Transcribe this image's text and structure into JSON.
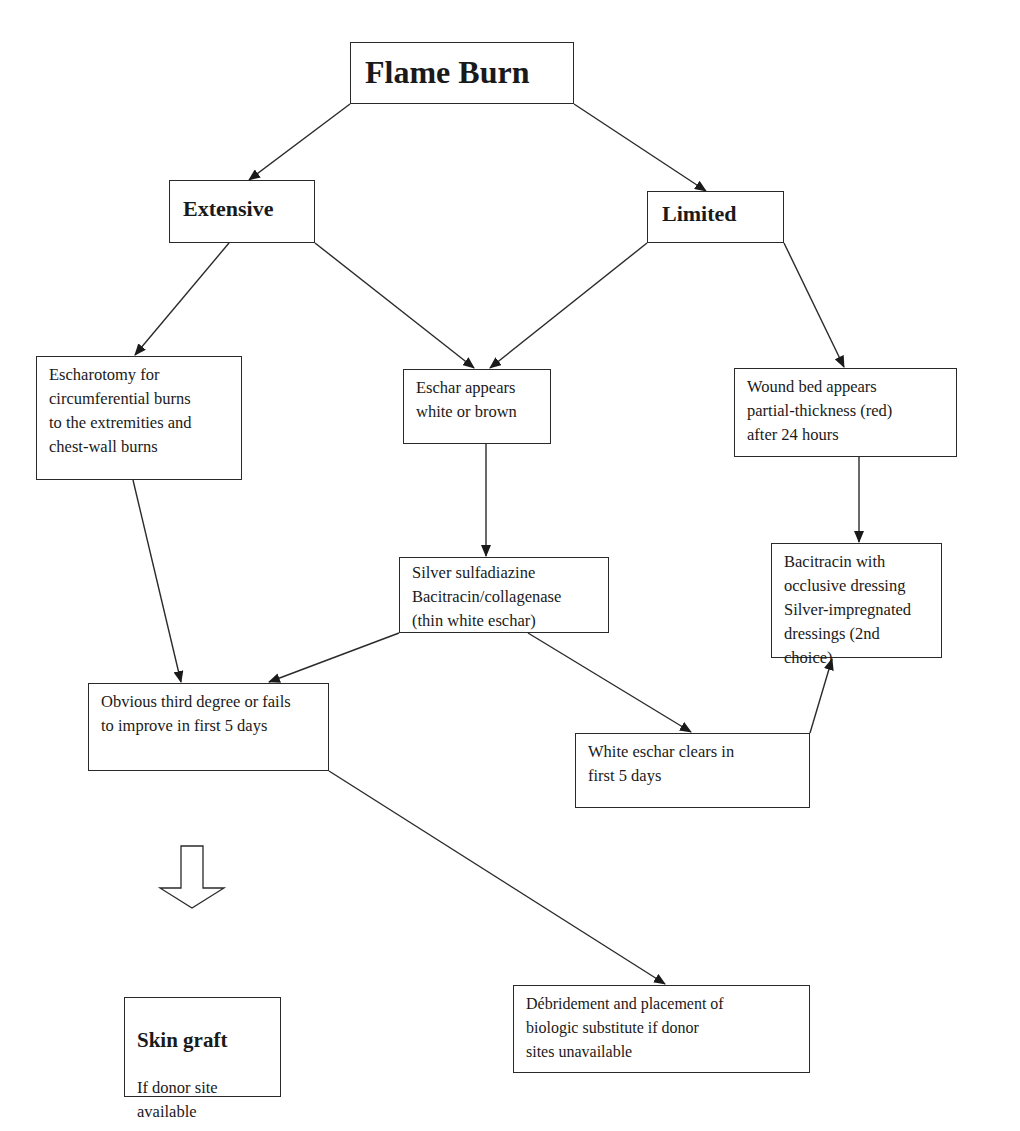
{
  "diagram": {
    "type": "flowchart",
    "title": "Flame Burn",
    "colors": {
      "line": "#2a2a2a",
      "text": "#1a1a1a",
      "background": "#ffffff"
    },
    "nodes": {
      "flame_burn": {
        "label": "Flame Burn"
      },
      "extensive": {
        "label": "Extensive"
      },
      "limited": {
        "label": "Limited"
      },
      "escharotomy": {
        "label": "Escharotomy for\ncircumferential burns\nto the extremities and\nchest-wall burns"
      },
      "eschar_appears": {
        "label": "Eschar appears\nwhite or brown"
      },
      "wound_bed": {
        "label": "Wound bed appears\npartial-thickness  (red)\nafter 24 hours"
      },
      "silver_sulfadiazine": {
        "label": "Silver sulfadiazine\nBacitracin/collagenase\n(thin white eschar)"
      },
      "bacitracin_occlusive": {
        "label": "Bacitracin with\nocclusive dressing\nSilver-impregnated\ndressings (2nd choice)"
      },
      "obvious_third_degree": {
        "label": "Obvious third degree or fails\nto improve in first 5 days"
      },
      "white_eschar_clears": {
        "label": "White eschar clears in\nfirst 5 days"
      },
      "debridement": {
        "label": "Débridement and placement of\nbiologic substitute if donor\nsites unavailable"
      },
      "skin_graft": {
        "title": "Skin graft",
        "subtitle": "If donor site\navailable"
      }
    },
    "edges": [
      {
        "from": "flame_burn",
        "to": "extensive"
      },
      {
        "from": "flame_burn",
        "to": "limited"
      },
      {
        "from": "extensive",
        "to": "escharotomy"
      },
      {
        "from": "extensive",
        "to": "eschar_appears"
      },
      {
        "from": "limited",
        "to": "eschar_appears"
      },
      {
        "from": "limited",
        "to": "wound_bed"
      },
      {
        "from": "eschar_appears",
        "to": "silver_sulfadiazine"
      },
      {
        "from": "wound_bed",
        "to": "bacitracin_occlusive"
      },
      {
        "from": "escharotomy",
        "to": "obvious_third_degree"
      },
      {
        "from": "silver_sulfadiazine",
        "to": "obvious_third_degree"
      },
      {
        "from": "silver_sulfadiazine",
        "to": "white_eschar_clears"
      },
      {
        "from": "white_eschar_clears",
        "to": "bacitracin_occlusive"
      },
      {
        "from": "obvious_third_degree",
        "to": "debridement"
      },
      {
        "from": "obvious_third_degree",
        "to": "skin_graft",
        "style": "hollow-block-arrow"
      }
    ]
  }
}
